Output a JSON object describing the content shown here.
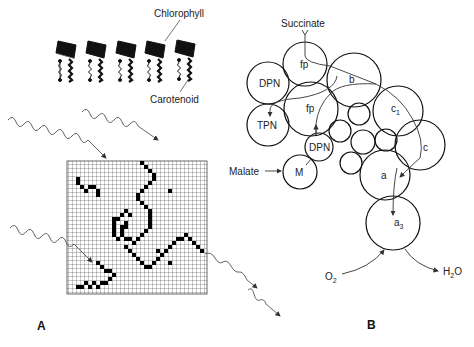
{
  "panel_a": {
    "label": "A",
    "chlorophyll_label": "Chlorophyll",
    "carotenoid_label": "Carotenoid",
    "pigment_count": 5,
    "grid": {
      "cols": 36,
      "rows": 36
    }
  },
  "panel_b": {
    "label": "B",
    "succinate_label": "Succinate",
    "malate_label": "Malate",
    "o2_label": "O",
    "o2_sub": "2",
    "h2o_label_h": "H",
    "h2o_sub": "2",
    "h2o_label_o": "O",
    "circles": {
      "fp_top": "fp",
      "b": "b",
      "dpn_left": "DPN",
      "fp_mid": "fp",
      "tpn": "TPN",
      "c1": "c",
      "c1_sub": "1",
      "c": "c",
      "dpn_small": "DPN",
      "m": "M",
      "a": "a",
      "a3": "a",
      "a3_sub": "3"
    }
  }
}
